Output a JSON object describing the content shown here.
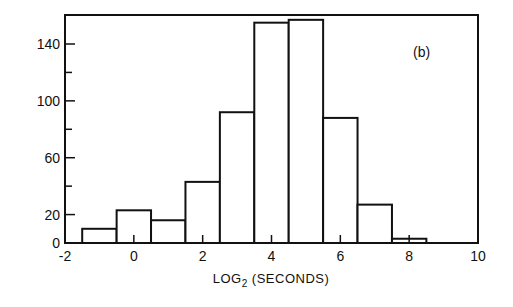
{
  "chart_data": {
    "type": "bar",
    "subtype": "histogram",
    "title": "",
    "panel_label": "(b)",
    "xlabel": "LOG2 (SECONDS)",
    "xlabel_main": "LOG",
    "xlabel_sub": "2",
    "xlabel_rest": " (SECONDS)",
    "ylabel": "",
    "xlim": [
      -2,
      10
    ],
    "ylim": [
      0,
      160
    ],
    "x_ticks": [
      -2,
      0,
      2,
      4,
      6,
      8,
      10
    ],
    "x_tick_labels": [
      "-2",
      "0",
      "2",
      "4",
      "6",
      "8",
      "10"
    ],
    "y_ticks_major": [
      0,
      20,
      60,
      100,
      140
    ],
    "y_tick_labels": [
      "0",
      "20",
      "60",
      "100",
      "140"
    ],
    "y_ticks_minor": [
      40,
      80,
      120
    ],
    "bin_edges": [
      -1.5,
      -0.5,
      0.5,
      1.5,
      2.5,
      3.5,
      4.5,
      5.5,
      6.5,
      7.5,
      8.5
    ],
    "categories": [
      "-1",
      "0",
      "1",
      "2",
      "3",
      "4",
      "5",
      "6",
      "7",
      "8"
    ],
    "values": [
      10,
      23,
      16,
      43,
      92,
      155,
      157,
      88,
      27,
      3
    ],
    "grid": false,
    "legend": null
  }
}
